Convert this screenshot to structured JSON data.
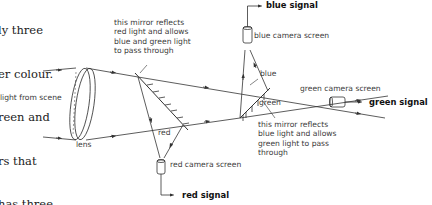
{
  "body_text": {
    "lines": [
      "ly three",
      "er colour.",
      "reen and",
      "rs that",
      "has three",
      "ours."
    ]
  },
  "diagram": {
    "labels": {
      "light_from_scene": "light from scene",
      "lens": "lens",
      "mirror1_note": "this mirror reflects\nred light and allows\nblue and green light\nto pass through",
      "mirror2_note": "this mirror reflects\nblue light and allows\ngreen light to pass\nthrough",
      "red": "red",
      "blue": "blue",
      "green": "green",
      "red_camera": "red camera screen",
      "blue_camera": "blue camera screen",
      "green_camera": "green camera screen"
    },
    "signals": {
      "red": "red signal",
      "blue": "blue signal",
      "green": "green signal"
    },
    "line_color": "#333333"
  }
}
